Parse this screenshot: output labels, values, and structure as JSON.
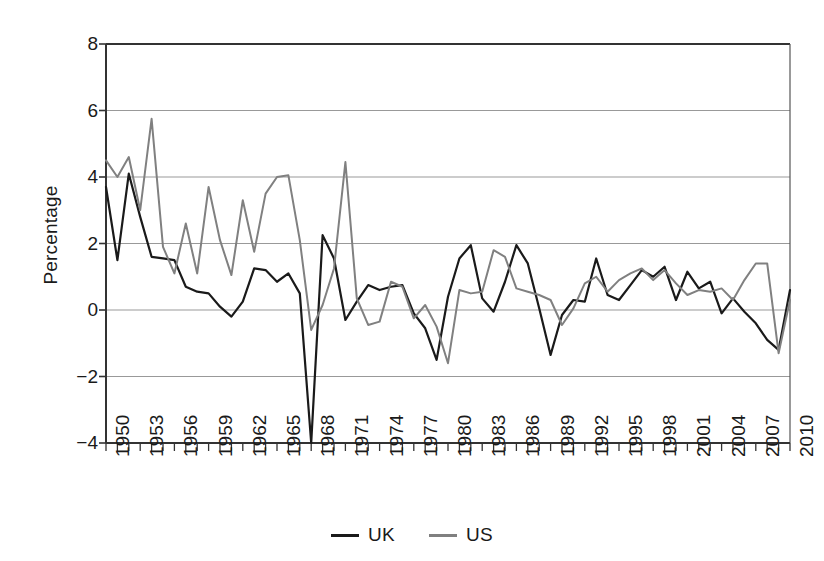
{
  "chart_data": {
    "type": "line",
    "title": "",
    "xlabel": "",
    "ylabel": "Percentage",
    "xlim": [
      1950,
      2010
    ],
    "ylim": [
      -4,
      8
    ],
    "ytick_values": [
      -4,
      -2,
      0,
      2,
      4,
      6,
      8
    ],
    "ytick_labels": [
      "−4",
      "−2",
      "0",
      "2",
      "4",
      "6",
      "8"
    ],
    "xtick_values": [
      1950,
      1953,
      1956,
      1959,
      1962,
      1965,
      1968,
      1971,
      1974,
      1977,
      1980,
      1983,
      1986,
      1989,
      1992,
      1995,
      1998,
      2001,
      2004,
      2007,
      2010
    ],
    "xtick_labels": [
      "1950",
      "1953",
      "1956",
      "1959",
      "1962",
      "1965",
      "1968",
      "1971",
      "1974",
      "1977",
      "1980",
      "1983",
      "1986",
      "1989",
      "1992",
      "1995",
      "1998",
      "2001",
      "2004",
      "2007",
      "2010"
    ],
    "grid": "horizontal",
    "legend_position": "bottom",
    "x": [
      1950,
      1951,
      1952,
      1953,
      1954,
      1955,
      1956,
      1957,
      1958,
      1959,
      1960,
      1961,
      1962,
      1963,
      1964,
      1965,
      1966,
      1967,
      1968,
      1969,
      1970,
      1971,
      1972,
      1973,
      1974,
      1975,
      1976,
      1977,
      1978,
      1979,
      1980,
      1981,
      1982,
      1983,
      1984,
      1985,
      1986,
      1987,
      1988,
      1989,
      1990,
      1991,
      1992,
      1993,
      1994,
      1995,
      1996,
      1997,
      1998,
      1999,
      2000,
      2001,
      2002,
      2003,
      2004,
      2005,
      2006,
      2007,
      2008,
      2009,
      2010
    ],
    "series": [
      {
        "name": "UK",
        "color": "#1a1a1a",
        "values": [
          3.7,
          1.5,
          4.1,
          2.8,
          1.6,
          1.55,
          1.5,
          0.7,
          0.55,
          0.5,
          0.1,
          -0.2,
          0.25,
          1.25,
          1.2,
          0.85,
          1.1,
          0.5,
          -4.0,
          2.25,
          1.55,
          -0.3,
          0.25,
          0.75,
          0.6,
          0.7,
          0.75,
          -0.1,
          -0.55,
          -1.5,
          0.4,
          1.55,
          1.95,
          0.35,
          -0.05,
          0.85,
          1.95,
          1.4,
          0.05,
          -1.35,
          -0.15,
          0.3,
          0.25,
          1.55,
          0.45,
          0.3,
          0.75,
          1.2,
          1.0,
          1.3,
          0.3,
          1.15,
          0.65,
          0.85,
          -0.1,
          0.35,
          -0.05,
          -0.4,
          -0.9,
          -1.2,
          0.6
        ]
      },
      {
        "name": "US",
        "color": "#808080",
        "values": [
          4.5,
          4.0,
          4.6,
          3.0,
          5.75,
          1.9,
          1.1,
          2.6,
          1.1,
          3.7,
          2.1,
          1.05,
          3.3,
          1.75,
          3.5,
          4.0,
          4.05,
          2.1,
          -0.6,
          0.15,
          1.25,
          4.45,
          0.35,
          -0.45,
          -0.35,
          0.85,
          0.7,
          -0.25,
          0.15,
          -0.5,
          -1.6,
          0.6,
          0.5,
          0.55,
          1.8,
          1.6,
          0.65,
          0.55,
          0.45,
          0.3,
          -0.45,
          0.05,
          0.8,
          1.0,
          0.55,
          0.9,
          1.1,
          1.25,
          0.9,
          1.2,
          0.8,
          0.45,
          0.6,
          0.55,
          0.65,
          0.3,
          0.9,
          1.4,
          1.4,
          -1.3,
          0.3
        ]
      }
    ]
  },
  "legend": [
    {
      "label": "UK",
      "color": "#1a1a1a"
    },
    {
      "label": "US",
      "color": "#808080"
    }
  ],
  "axis": {
    "y_title": "Percentage"
  }
}
